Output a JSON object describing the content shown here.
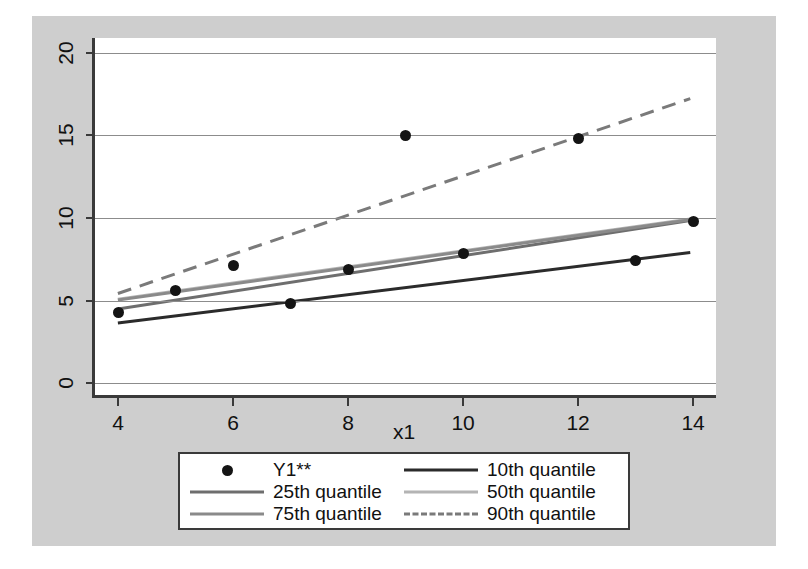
{
  "chart_data": {
    "type": "scatter",
    "title": "",
    "xlabel": "x1",
    "ylabel": "",
    "xlim": [
      3.6,
      14.45
    ],
    "ylim": [
      -0.9,
      20.9
    ],
    "xticks": [
      4,
      6,
      8,
      10,
      12,
      14
    ],
    "yticks": [
      0,
      5,
      10,
      15,
      20
    ],
    "grid": "horizontal",
    "legend_position": "bottom-center",
    "points": {
      "name": "Y1**",
      "marker": "filled-circle",
      "color": "#141414",
      "x": [
        4,
        5,
        6,
        7,
        8,
        9,
        10,
        12,
        13,
        14
      ],
      "y": [
        4.25,
        5.6,
        7.1,
        4.8,
        6.9,
        15.0,
        7.85,
        14.8,
        7.4,
        9.8
      ]
    },
    "series": [
      {
        "name": "10th quantile",
        "style": "solid",
        "color": "#2b2b2b",
        "width": 3,
        "x": [
          4,
          14
        ],
        "y": [
          3.5,
          7.8
        ]
      },
      {
        "name": "25th quantile",
        "style": "solid",
        "color": "#6e6e6e",
        "width": 3,
        "x": [
          4,
          14
        ],
        "y": [
          4.35,
          9.75
        ]
      },
      {
        "name": "50th quantile",
        "style": "solid",
        "color": "#b4b4b4",
        "width": 3,
        "x": [
          4,
          14
        ],
        "y": [
          4.95,
          9.85
        ]
      },
      {
        "name": "75th quantile",
        "style": "solid",
        "color": "#8a8a8a",
        "width": 3,
        "x": [
          4,
          14
        ],
        "y": [
          4.9,
          9.8
        ]
      },
      {
        "name": "90th quantile",
        "style": "dashed",
        "color": "#7a7a7a",
        "width": 3,
        "x": [
          4,
          14
        ],
        "y": [
          5.3,
          17.2
        ]
      }
    ]
  },
  "legend": {
    "entries": [
      {
        "label": "Y1**",
        "key": "marker"
      },
      {
        "label": "10th quantile",
        "key": "line-solid-dark"
      },
      {
        "label": "25th quantile",
        "key": "line-solid-gray"
      },
      {
        "label": "50th quantile",
        "key": "line-solid-light"
      },
      {
        "label": "75th quantile",
        "key": "line-solid-midgray"
      },
      {
        "label": "90th quantile",
        "key": "line-dashed-gray"
      }
    ]
  },
  "colors": {
    "figure_background": "#cecece",
    "plot_background": "#ffffff",
    "axis": "#3a3a3a",
    "gridline": "#8c8c8c"
  }
}
